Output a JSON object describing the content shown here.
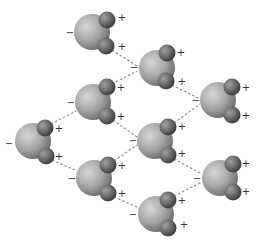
{
  "diagram": {
    "labels": {
      "negative": "−",
      "positive": "+"
    },
    "colors": {
      "oxygen_light": "#d4d4d4",
      "oxygen_mid": "#a8a8a8",
      "oxygen_dark": "#6e6e6e",
      "hydrogen_light": "#9a9a9a",
      "hydrogen_mid": "#6a6a6a",
      "hydrogen_dark": "#3a3a3a",
      "bond_line": "#888888",
      "charge_text": "#333333"
    },
    "molecules": [
      {
        "id": "m1",
        "o": [
          92,
          32
        ],
        "h1": [
          107,
          20
        ],
        "h2": [
          106,
          46
        ],
        "minus": [
          70,
          36
        ],
        "plus1": [
          122,
          21
        ],
        "plus2": [
          122,
          50
        ]
      },
      {
        "id": "m2",
        "o": [
          157,
          68
        ],
        "h1": [
          167,
          53
        ],
        "h2": [
          166,
          81
        ],
        "minus": [
          134,
          71
        ],
        "plus1": [
          181,
          56
        ],
        "plus2": [
          182,
          85
        ]
      },
      {
        "id": "m3",
        "o": [
          218,
          100
        ],
        "h1": [
          232,
          87
        ],
        "h2": [
          232,
          115
        ],
        "minus": [
          196,
          104
        ],
        "plus1": [
          246,
          91
        ],
        "plus2": [
          246,
          119
        ]
      },
      {
        "id": "m4",
        "o": [
          93,
          102
        ],
        "h1": [
          107,
          87
        ],
        "h2": [
          107,
          116
        ],
        "minus": [
          71,
          106
        ],
        "plus1": [
          121,
          91
        ],
        "plus2": [
          121,
          120
        ]
      },
      {
        "id": "m5",
        "o": [
          33,
          141
        ],
        "h1": [
          45,
          128
        ],
        "h2": [
          46,
          156
        ],
        "minus": [
          9,
          147
        ],
        "plus1": [
          59,
          132
        ],
        "plus2": [
          59,
          160
        ]
      },
      {
        "id": "m6",
        "o": [
          155,
          141
        ],
        "h1": [
          168,
          127
        ],
        "h2": [
          168,
          155
        ],
        "minus": [
          133,
          144
        ],
        "plus1": [
          182,
          130
        ],
        "plus2": [
          182,
          157
        ]
      },
      {
        "id": "m7",
        "o": [
          94,
          178
        ],
        "h1": [
          108,
          165
        ],
        "h2": [
          108,
          193
        ],
        "minus": [
          72,
          182
        ],
        "plus1": [
          122,
          169
        ],
        "plus2": [
          122,
          197
        ]
      },
      {
        "id": "m8",
        "o": [
          220,
          178
        ],
        "h1": [
          233,
          164
        ],
        "h2": [
          233,
          192
        ],
        "minus": [
          197,
          182
        ],
        "plus1": [
          246,
          167
        ],
        "plus2": [
          246,
          195
        ]
      },
      {
        "id": "m9",
        "o": [
          156,
          214
        ],
        "h1": [
          168,
          200
        ],
        "h2": [
          168,
          228
        ],
        "minus": [
          133,
          218
        ],
        "plus1": [
          182,
          204
        ],
        "plus2": [
          184,
          228
        ]
      }
    ],
    "hydrogen_bonds": [
      {
        "from": "m1.h2",
        "to": "m2.o",
        "x1": 112,
        "y1": 50,
        "x2": 137,
        "y2": 66
      },
      {
        "from": "m4.h1",
        "to": "m2.o",
        "x1": 112,
        "y1": 84,
        "x2": 137,
        "y2": 71
      },
      {
        "from": "m2.h2",
        "to": "m3.o",
        "x1": 172,
        "y1": 85,
        "x2": 200,
        "y2": 99
      },
      {
        "from": "m6.h1",
        "to": "m3.o",
        "x1": 174,
        "y1": 123,
        "x2": 200,
        "y2": 104
      },
      {
        "from": "m5.h1",
        "to": "m4.o",
        "x1": 51,
        "y1": 124,
        "x2": 76,
        "y2": 111
      },
      {
        "from": "m5.h2",
        "to": "m7.o",
        "x1": 52,
        "y1": 160,
        "x2": 77,
        "y2": 171
      },
      {
        "from": "m4.h2",
        "to": "m6.o",
        "x1": 113,
        "y1": 120,
        "x2": 137,
        "y2": 137
      },
      {
        "from": "m7.h1",
        "to": "m6.o",
        "x1": 114,
        "y1": 161,
        "x2": 137,
        "y2": 145
      },
      {
        "from": "m6.h2",
        "to": "m8.o",
        "x1": 174,
        "y1": 159,
        "x2": 202,
        "y2": 174
      },
      {
        "from": "m9.h1",
        "to": "m8.o",
        "x1": 174,
        "y1": 196,
        "x2": 202,
        "y2": 182
      },
      {
        "from": "m7.h2",
        "to": "m9.o",
        "x1": 114,
        "y1": 197,
        "x2": 139,
        "y2": 208
      }
    ]
  }
}
